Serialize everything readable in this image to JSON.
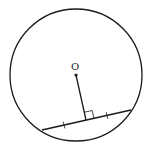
{
  "diagram": {
    "center_label": "O",
    "colors": {
      "stroke": "#1a1a1a",
      "background": "#ffffff"
    },
    "circle": {
      "cx": 76,
      "cy": 75,
      "r": 66
    },
    "chord": {
      "x1": 42,
      "y1": 130,
      "x2": 131,
      "y2": 110
    },
    "perpendicular_foot": {
      "x": 86,
      "y": 120
    },
    "tick_marks": [
      {
        "x": 64,
        "y": 125
      },
      {
        "x": 107,
        "y": 115.5
      }
    ]
  }
}
